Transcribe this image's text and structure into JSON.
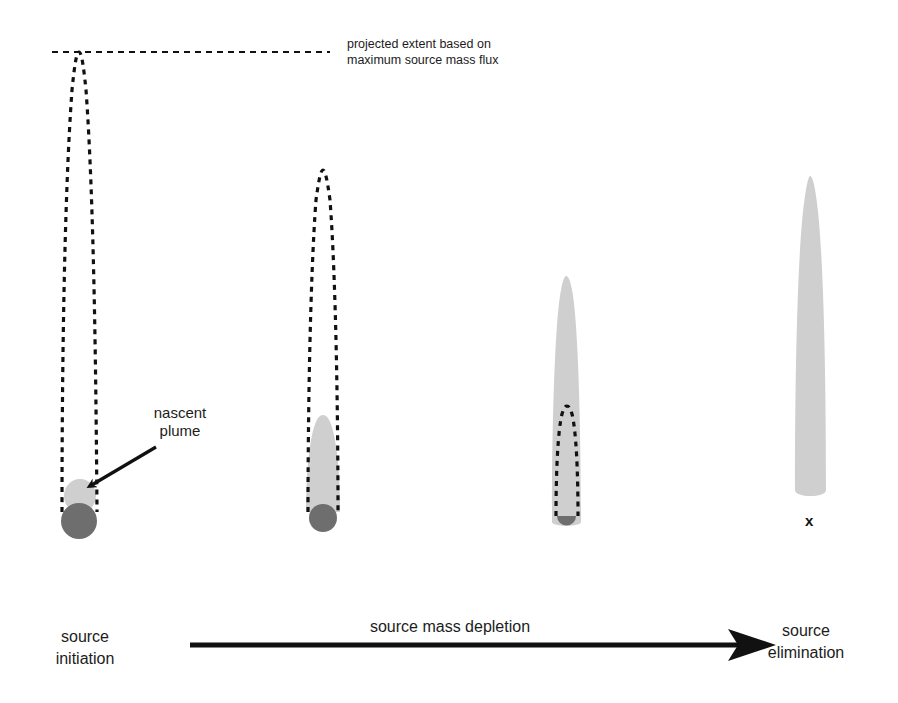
{
  "diagram": {
    "title": "",
    "annotation_projected": {
      "line1": "projected extent based on",
      "line2": "maximum source mass flux"
    },
    "nascent_plume_label": {
      "line1": "nascent",
      "line2": "plume"
    },
    "stages": [
      {
        "name": "source initiation",
        "line1": "source",
        "line2": "initiation"
      },
      {
        "name": "stage-2",
        "line1": "",
        "line2": ""
      },
      {
        "name": "stage-3",
        "line1": "",
        "line2": ""
      },
      {
        "name": "source elimination",
        "line1": "source",
        "line2": "elimination"
      }
    ],
    "depletion_arrow_label": "source mass depletion",
    "eliminated_source_marker": "x",
    "legend": {
      "dashed_outline": "projected extent based on maximum source mass flux",
      "light_gray_fill": "plume",
      "dark_gray_circle": "source"
    },
    "colors": {
      "dashed": "#111111",
      "plume_fill": "#cfcfcf",
      "source_fill": "#6e6e6e",
      "arrow": "#111111",
      "text": "#1c1c1c"
    }
  }
}
